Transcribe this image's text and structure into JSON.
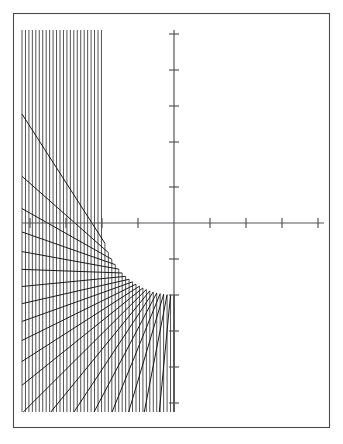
{
  "figure": {
    "background_color": "#ffffff",
    "frame_color": "#4a4a52",
    "axis_color": "#55555d",
    "incident_ray_color": "#1a1a1a",
    "reflected_ray_color": "#111111"
  },
  "frame": {
    "x": 13.5,
    "y": 13.5,
    "width": 316,
    "height": 414
  },
  "chart_data": {
    "type": "line",
    "xlabel": "",
    "ylabel": "",
    "grid": false,
    "legend": "none",
    "origin_px": {
      "x": 174,
      "y": 223
    },
    "tick_spacing_px": 36,
    "axes": {
      "x_axis": {
        "x_start_px": 22,
        "x_end_px": 324,
        "y_px": 223
      },
      "y_axis": {
        "y_start_px": 30,
        "y_end_px": 412,
        "x_px": 174
      },
      "x_ticks_px": [
        30,
        66,
        102,
        138,
        210,
        246,
        282,
        318
      ],
      "y_ticks_px": [
        34,
        70,
        106,
        142,
        187,
        259,
        295,
        331,
        367,
        403
      ],
      "tick_half_length_px": 5
    },
    "mirror_circle": {
      "center_px": {
        "x": 174,
        "y": 223
      },
      "radius_px": 72,
      "arc_drawn": "reflecting arc, left half"
    },
    "incident_rays": {
      "description": "Parallel vertical rays travelling downward, drawn only below the reflecting arc",
      "count": 45,
      "direction": "vertical",
      "x_min_px": 22,
      "x_max_px": 174,
      "bottom_y_px": 412,
      "spacing_px": 3.45
    },
    "reflected_rays": {
      "description": "Each incident ray reflects off the circle; the reflected family envelopes the caustic",
      "count": 45,
      "clip_box_px": {
        "left": 22,
        "right": 324,
        "top": 30,
        "bottom": 412
      }
    },
    "caustic": {
      "type": "cardioid-like envelope",
      "cusp_px": {
        "x": 174,
        "y": 252
      },
      "leftmost_px": {
        "x": 131,
        "y": 205
      },
      "apex_px": {
        "x": 200,
        "y": 143
      }
    }
  }
}
